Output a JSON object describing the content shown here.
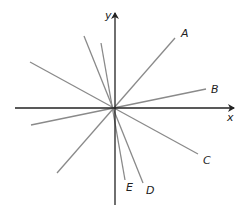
{
  "diagram": {
    "axes": {
      "x_label": "x",
      "y_label": "y",
      "origin": [
        114,
        108
      ],
      "x_axis": {
        "x1": 15,
        "y1": 108,
        "x2": 234,
        "y2": 108
      },
      "y_axis": {
        "x1": 115,
        "y1": 205,
        "x2": 115,
        "y2": 13
      },
      "color": "#222222"
    },
    "line_color": "#8a8a8a",
    "lines": [
      {
        "label": "A",
        "x1": 57,
        "y1": 173,
        "x2": 175,
        "y2": 38,
        "label_x": 181,
        "label_y": 37
      },
      {
        "label": "B",
        "x1": 31,
        "y1": 125,
        "x2": 206,
        "y2": 89,
        "label_x": 211,
        "label_y": 93
      },
      {
        "label": "C",
        "x1": 30,
        "y1": 62,
        "x2": 198,
        "y2": 154,
        "label_x": 203,
        "label_y": 164
      },
      {
        "label": "D",
        "x1": 84,
        "y1": 36,
        "x2": 143,
        "y2": 183,
        "label_x": 146,
        "label_y": 194
      },
      {
        "label": "E",
        "x1": 101,
        "y1": 43,
        "x2": 125,
        "y2": 180,
        "label_x": 126,
        "label_y": 191
      }
    ]
  }
}
